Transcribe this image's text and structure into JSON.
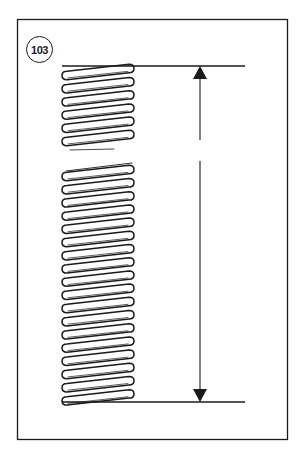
{
  "figure": {
    "number": "103"
  },
  "colors": {
    "line": "#1a1a1a",
    "background": "#ffffff"
  },
  "geometry": {
    "frame": {
      "x": 17,
      "y": 19,
      "width": 271,
      "height": 421
    },
    "spring": {
      "left": 62,
      "right": 134,
      "top": 66,
      "bottom": 402,
      "coil_pitch": 13.2,
      "break_top": 147,
      "break_bottom": 165
    },
    "dimension": {
      "x": 200,
      "top": 66,
      "bottom": 402,
      "gap_top": 140,
      "gap_bottom": 161,
      "line_right": 245
    }
  }
}
